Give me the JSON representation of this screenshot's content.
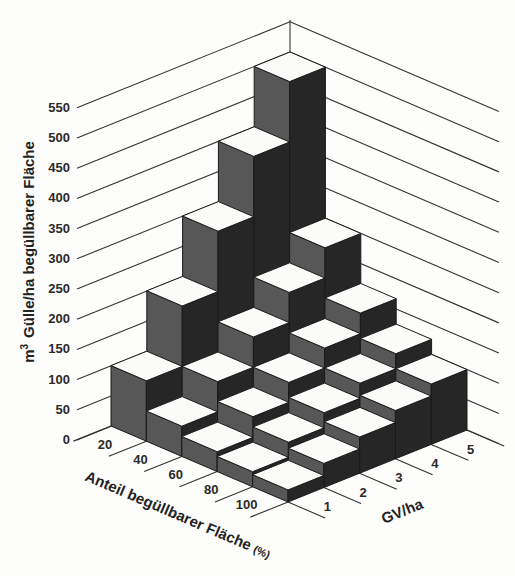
{
  "chart_data": {
    "type": "bar3d",
    "title": "",
    "zlabel": "m³ Gülle/ha begüllbarer Fläche",
    "xlabel": "Anteil begüllbarer Fläche (%)",
    "ylabel": "GV/ha",
    "x_categories": [
      "20",
      "40",
      "60",
      "80",
      "100"
    ],
    "y_categories": [
      "1",
      "2",
      "3",
      "4",
      "5"
    ],
    "z_ticks": [
      "0",
      "50",
      "100",
      "150",
      "200",
      "250",
      "300",
      "350",
      "400",
      "450",
      "500",
      "550"
    ],
    "zlim": [
      0,
      550
    ],
    "grid": true,
    "series": [
      {
        "name": "20",
        "values": [
          100,
          200,
          300,
          400,
          500
        ]
      },
      {
        "name": "40",
        "values": [
          50,
          100,
          150,
          200,
          250
        ]
      },
      {
        "name": "60",
        "values": [
          33,
          67,
          100,
          133,
          167
        ]
      },
      {
        "name": "80",
        "values": [
          25,
          50,
          75,
          100,
          125
        ]
      },
      {
        "name": "100",
        "values": [
          20,
          40,
          60,
          80,
          100
        ]
      }
    ],
    "note": "rows = Anteil begüllbarer Fläche (%), columns = GV/ha 1..5"
  },
  "labels": {
    "z_title_unit": "m",
    "z_title_sup": "3",
    "z_title_rest": "Gülle/ha begüllbarer Fläche",
    "x_title": "Anteil begüllbarer Fläche",
    "x_title_unit": "(%)",
    "y_title": "GV/ha"
  },
  "colors": {
    "top": "#fbfbf9",
    "left_face": "#575757",
    "right_face": "#262626",
    "lines": "#333333"
  }
}
